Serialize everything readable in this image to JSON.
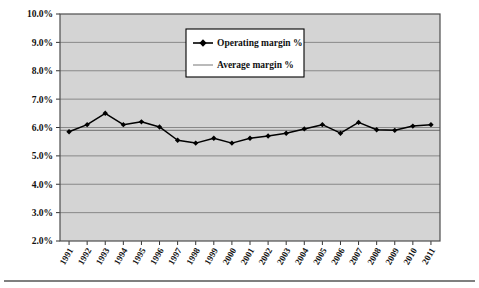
{
  "chart_data": {
    "type": "line",
    "title": "",
    "xlabel": "",
    "ylabel": "",
    "grid": true,
    "legend_position": "top-center",
    "categories": [
      "1991",
      "1992",
      "1993",
      "1994",
      "1995",
      "1996",
      "1997",
      "1998",
      "1999",
      "2000",
      "2001",
      "2002",
      "2003",
      "2004",
      "2005",
      "2006",
      "2007",
      "2008",
      "2009",
      "2010",
      "2011"
    ],
    "ylim": [
      2.0,
      10.0
    ],
    "ytick_labels": [
      "10.0%",
      "9.0%",
      "8.0%",
      "7.0%",
      "6.0%",
      "5.0%",
      "4.0%",
      "3.0%",
      "2.0%"
    ],
    "ytick_values": [
      10.0,
      9.0,
      8.0,
      7.0,
      6.0,
      5.0,
      4.0,
      3.0,
      2.0
    ],
    "series": [
      {
        "name": "Operating margin %",
        "marker": "diamond",
        "color": "#000000",
        "values": [
          5.85,
          6.1,
          6.5,
          6.1,
          6.2,
          6.02,
          5.55,
          5.45,
          5.62,
          5.45,
          5.62,
          5.7,
          5.8,
          5.95,
          6.1,
          5.8,
          6.18,
          5.92,
          5.9,
          6.05,
          6.1
        ]
      },
      {
        "name": "Average margin %",
        "marker": "none",
        "color": "#808080",
        "constant_value": 5.9
      }
    ],
    "legend": [
      "Operating margin %",
      "Average margin %"
    ]
  },
  "plot": {
    "background_color": "#d4d4d4",
    "gridline_color": "#808080",
    "axis_color": "#333333",
    "legend_background": "#ffffff",
    "legend_border": "#000000"
  },
  "footer": {
    "rule": ""
  }
}
